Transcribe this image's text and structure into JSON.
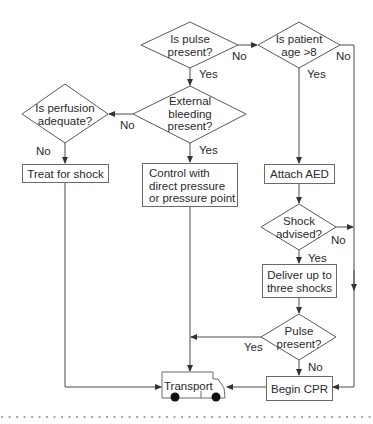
{
  "flowchart": {
    "decisions": {
      "pulse_present": {
        "line1": "Is pulse",
        "line2": "present?"
      },
      "patient_age": {
        "line1": "Is patient",
        "line2": "age >8"
      },
      "external_bleeding": {
        "line1": "External",
        "line2": "bleeding",
        "line3": "present?"
      },
      "perfusion": {
        "line1": "Is perfusion",
        "line2": "adequate?"
      },
      "shock_advised": {
        "line1": "Shock",
        "line2": "advised?"
      },
      "pulse_present_2": {
        "line1": "Pulse",
        "line2": "present?"
      }
    },
    "actions": {
      "treat_shock": "Treat for shock",
      "control_bleeding": {
        "line1": "Control with",
        "line2": "direct pressure",
        "line3": "or pressure point"
      },
      "attach_aed": "Attach AED",
      "deliver_shocks": {
        "line1": "Deliver up to",
        "line2": "three shocks"
      },
      "begin_cpr": "Begin CPR",
      "transport": "Transport"
    },
    "edge_labels": {
      "pulse_no": "No",
      "pulse_yes": "Yes",
      "age_no": "No",
      "age_yes": "Yes",
      "bleeding_no": "No",
      "bleeding_yes": "Yes",
      "perfusion_no": "No",
      "shock_no": "No",
      "shock_yes": "Yes",
      "pulse2_yes": "Yes",
      "pulse2_no": "No"
    },
    "colors": {
      "line": "#4a4a4a",
      "box_border": "#6a6a6a",
      "dots": "#9a9a9a",
      "wheel": "#111111"
    }
  }
}
